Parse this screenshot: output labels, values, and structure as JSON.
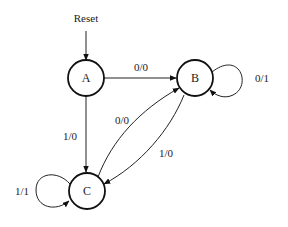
{
  "diagram": {
    "type": "finite-state-machine",
    "reset_label": "Reset",
    "initial_state": "A",
    "states": [
      {
        "id": "A",
        "label": "A"
      },
      {
        "id": "B",
        "label": "B"
      },
      {
        "id": "C",
        "label": "C"
      }
    ],
    "transitions": [
      {
        "from": "A",
        "to": "B",
        "label": "0/0"
      },
      {
        "from": "A",
        "to": "C",
        "label": "1/0"
      },
      {
        "from": "B",
        "to": "B",
        "label": "0/1"
      },
      {
        "from": "B",
        "to": "C",
        "label": "1/0"
      },
      {
        "from": "C",
        "to": "B",
        "label": "0/0"
      },
      {
        "from": "C",
        "to": "C",
        "label": "1/1"
      }
    ]
  }
}
